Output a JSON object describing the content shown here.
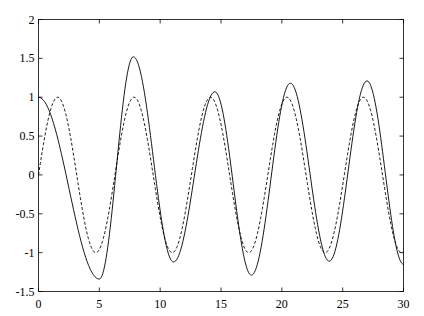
{
  "chart_data": {
    "type": "line",
    "title": "",
    "xlabel": "",
    "ylabel": "",
    "xlim": [
      0,
      30
    ],
    "ylim": [
      -1.5,
      2
    ],
    "grid": false,
    "legend": null,
    "xticks": [
      0,
      5,
      10,
      15,
      20,
      25,
      30
    ],
    "xtick_labels": [
      "0",
      "5",
      "10",
      "15",
      "20",
      "25",
      "30"
    ],
    "yticks": [
      -1.5,
      -1,
      -0.5,
      0,
      0.5,
      1,
      1.5,
      2
    ],
    "ytick_labels": [
      "-1.5",
      "-1",
      "-0.5",
      "0",
      "0.5",
      "1",
      "1.5",
      "2"
    ],
    "series": [
      {
        "name": "solid",
        "style": "solid",
        "color": "#000000",
        "extrema": [
          [
            0,
            1.0
          ],
          [
            5.0,
            -1.34
          ],
          [
            7.8,
            1.52
          ],
          [
            11.1,
            -1.12
          ],
          [
            14.5,
            1.07
          ],
          [
            17.5,
            -1.29
          ],
          [
            20.7,
            1.18
          ],
          [
            23.9,
            -1.11
          ],
          [
            27.0,
            1.21
          ],
          [
            30,
            -1.15
          ]
        ]
      },
      {
        "name": "dashed",
        "style": "dashed",
        "color": "#000000",
        "function": "sin(t)",
        "x": [
          0,
          1.57,
          3.14,
          4.71,
          6.28,
          7.85,
          9.42,
          11.0,
          12.57,
          14.14,
          15.71,
          17.28,
          18.85,
          20.42,
          21.99,
          23.56,
          25.13,
          26.7,
          28.27,
          29.85,
          30
        ],
        "values": [
          0,
          1,
          0,
          -1,
          0,
          1,
          0,
          -1,
          0,
          1,
          0,
          -1,
          0,
          1,
          0,
          -1,
          0,
          1,
          0,
          -1,
          -0.99
        ]
      }
    ]
  }
}
